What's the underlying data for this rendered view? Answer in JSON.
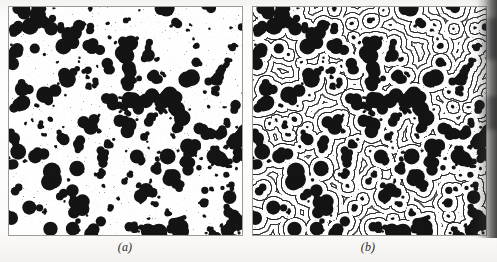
{
  "figure": {
    "type": "scanned-figure",
    "panel_count": 2,
    "background_color": "#fdfdfc",
    "ink_color": "#141414",
    "border_color": "#9a9a97"
  },
  "panels": [
    {
      "id": "a",
      "caption": "(a)",
      "rendering": "blobs-only",
      "x": 8,
      "y": 6,
      "width": 235,
      "height": 230,
      "caption_center_x": 125,
      "caption_y": 240,
      "description": "Binary droplet field: irregular black blobs on white background",
      "blob_count": 300,
      "fringes": false
    },
    {
      "id": "b",
      "caption": "(b)",
      "rendering": "blobs-with-interference-fringes",
      "x": 252,
      "y": 6,
      "width": 235,
      "height": 230,
      "caption_center_x": 368,
      "caption_y": 240,
      "description": "Same droplet field overlaid with concentric interference fringe contours",
      "blob_count": 300,
      "fringes": true,
      "fringe_period": 5.1,
      "fringe_line_width": 1.0
    }
  ],
  "chart_data": {
    "type": "scatter",
    "title": "",
    "xlabel": "",
    "ylabel": "",
    "seed": 20240517,
    "field_width": 235,
    "field_height": 230,
    "legend": [],
    "grid": false,
    "series": [
      {
        "name": "droplets",
        "marker": "filled-irregular-disk",
        "color": "#141414",
        "count": 300,
        "radius_min": 1.1,
        "radius_max": 8.6,
        "radius_distribution": "power-law-biased-small",
        "lobes_per_blob": [
          1,
          4
        ],
        "clustering": 0.34
      }
    ],
    "overlay": {
      "name": "interference-fringes",
      "panel": "b",
      "type": "concentric-contours",
      "period_px": 5.1,
      "color": "#141414",
      "linewidth_px": 1.0,
      "description": "Distance-transform contour rings radiating outward from every droplet, merging between neighbours"
    }
  },
  "scan_artifacts": {
    "right_edge_shadow": true,
    "shadow_width_px": 28,
    "shadow_color": "#191817",
    "paper_tint_top": "#f4f3f1",
    "paper_tint_bottom": "#f2f1ef",
    "speckle": true
  }
}
